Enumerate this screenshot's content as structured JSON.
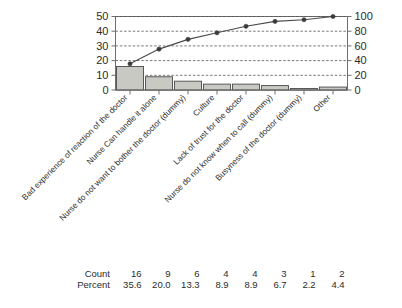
{
  "chart_data": {
    "type": "bar",
    "title": "",
    "subtitle": "",
    "xlabel": "",
    "ylabel": "",
    "y2label": "",
    "grid": true,
    "legend": "none",
    "categories": [
      "Bad experience of reaction of the doctor",
      "Nurse Can handle it alone",
      "Nurse do not want to bother the doctor (dummy)",
      "Culture",
      "Lack of trust for the doctor",
      "Nurse do not know when to call (dummy)",
      "Busyness of the doctor (dummy)",
      "Other"
    ],
    "values": [
      16,
      9,
      6,
      4,
      4,
      3,
      1,
      2
    ],
    "ylim": [
      0,
      50
    ],
    "yticks": [
      0,
      10,
      20,
      30,
      40,
      50
    ],
    "y2lim": [
      0,
      100
    ],
    "y2ticks": [
      0,
      20,
      40,
      60,
      80,
      100
    ],
    "series": [
      {
        "name": "Count",
        "type": "bar",
        "axis": "left",
        "values": [
          16,
          9,
          6,
          4,
          4,
          3,
          1,
          2
        ]
      },
      {
        "name": "Cumulative Percent",
        "type": "line",
        "axis": "right",
        "values": [
          35.6,
          55.6,
          68.9,
          77.8,
          86.7,
          93.3,
          95.6,
          100.0
        ]
      }
    ],
    "bar_fill": "#c9c9c4",
    "bar_stroke": "#4a4a4a",
    "line_color": "#4a4a4a",
    "marker_color": "#3a3a3a"
  },
  "axes": {
    "left_ticks": [
      "50",
      "40",
      "30",
      "20",
      "10",
      "0"
    ],
    "right_ticks": [
      "100",
      "80",
      "60",
      "40",
      "20",
      "0"
    ]
  },
  "category_labels": [
    "Bad experience of reaction of the doctor",
    "Nurse Can handle it alone",
    "Nurse do not want to bother the doctor (dummy)",
    "Culture",
    "Lack of trust for the doctor",
    "Nurse do not know when to call (dummy)",
    "Busyness of the doctor (dummy)",
    "Other"
  ],
  "table": {
    "row_labels": [
      "Count",
      "Percent"
    ],
    "count": [
      "16",
      "9",
      "6",
      "4",
      "4",
      "3",
      "1",
      "2"
    ],
    "percent": [
      "35.6",
      "20.0",
      "13.3",
      "8.9",
      "8.9",
      "6.7",
      "2.2",
      "4.4"
    ]
  }
}
